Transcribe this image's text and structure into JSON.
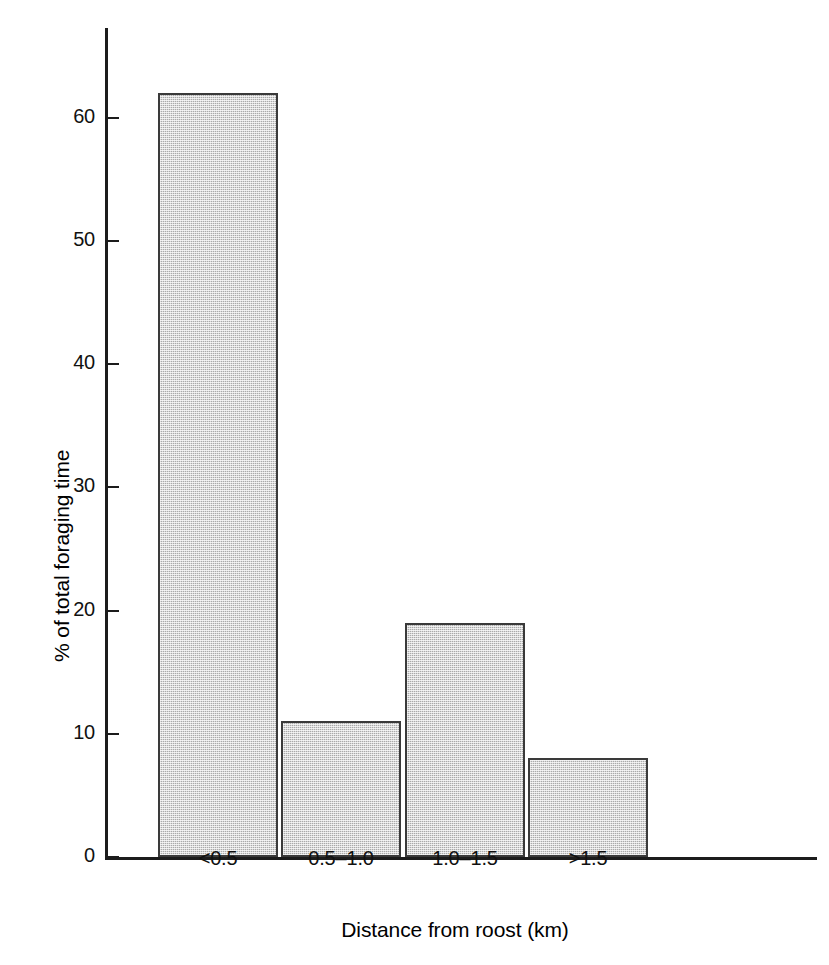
{
  "chart_data": {
    "type": "bar",
    "title": "",
    "subtitle": "",
    "xlabel": "Distance from roost (km)",
    "ylabel": "% of total foraging time",
    "categories": [
      "<0.5",
      "0.5–1.0",
      "1.0–1.5",
      ">1.5"
    ],
    "values": [
      62,
      11,
      19,
      8
    ],
    "ylim": [
      0,
      65
    ],
    "yticks": [
      0,
      10,
      20,
      30,
      40,
      50,
      60
    ],
    "ytick_labels": [
      "0",
      "10",
      "20",
      "30",
      "40",
      "50",
      "60"
    ],
    "grid": false,
    "legend": false,
    "legend_position": "none",
    "bar_fill_color": "#aaaaaa",
    "bar_edge_color": "#3a3a3a",
    "axis_color": "#1c1c1c",
    "background_color": "#ffffff",
    "bars": [
      {
        "category": "<0.5",
        "value": 62
      },
      {
        "category": "0.5–1.0",
        "value": 11
      },
      {
        "category": "1.0–1.5",
        "value": 19
      },
      {
        "category": ">1.5",
        "value": 8
      }
    ]
  }
}
